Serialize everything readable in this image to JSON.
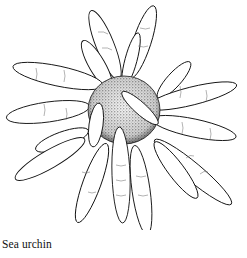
{
  "figure": {
    "caption": "Sea urchin"
  }
}
